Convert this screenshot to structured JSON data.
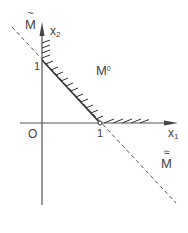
{
  "diagram": {
    "type": "geometric-set-diagram",
    "axes": {
      "x_label": "x",
      "x_sub": "1",
      "y_label": "x",
      "y_sub": "2",
      "origin_label": "O"
    },
    "ticks": {
      "y_unit_label": "1",
      "x_unit_label": "1"
    },
    "regions": {
      "feasible_set_label": "M",
      "feasible_set_sup": "0"
    },
    "lines": {
      "upper_dashed_label": "M",
      "upper_dashed_tilde": "~",
      "lower_dashed_label": "M",
      "lower_dashed_tilde": "≈"
    },
    "colors": {
      "ink": "#444444",
      "background": "#ffffff"
    }
  }
}
